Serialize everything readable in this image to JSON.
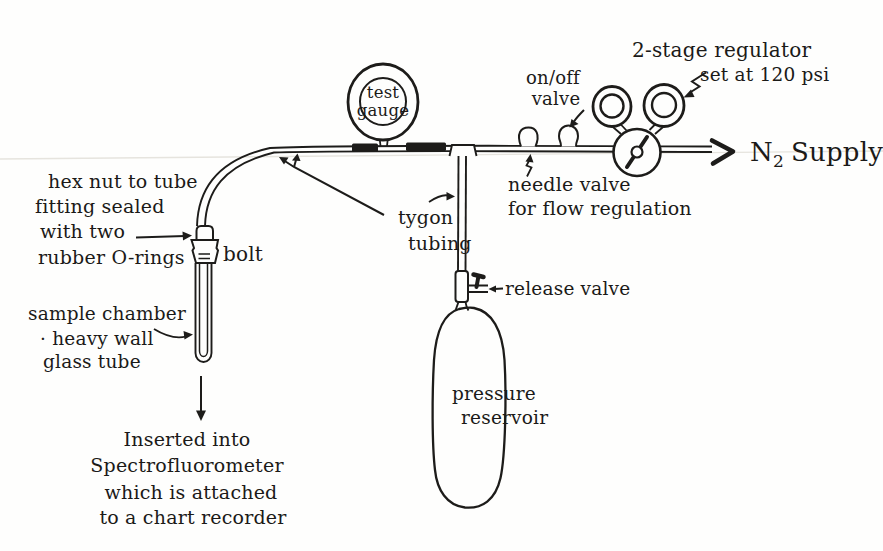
{
  "diagram_title": "Hand-drawn nitrogen pressurization apparatus schematic",
  "colors": {
    "ink": "#1d1c1a",
    "paper": "#fefefd"
  },
  "labels": {
    "hex_nut": [
      "hex nut to tube",
      "fitting sealed",
      "with two",
      "rubber O-rings"
    ],
    "bolt": "bolt",
    "sample_chamber": [
      "sample chamber",
      "· heavy wall",
      "glass tube"
    ],
    "inserted": [
      "Inserted into",
      "Spectrofluorometer",
      "which is attached",
      "to a chart recorder"
    ],
    "tygon": [
      "tygon",
      "tubing"
    ],
    "test_gauge": [
      "test",
      "gauge"
    ],
    "on_off_valve": [
      "on/off",
      "valve"
    ],
    "regulator": [
      "2-stage regulator",
      "set at 120 psi"
    ],
    "n2_supply": {
      "symbol": "N",
      "subscript": "2",
      "word": "Supply"
    },
    "needle_valve": [
      "needle valve",
      "for flow regulation"
    ],
    "release_valve": "release valve",
    "pressure_reservoir": [
      "pressure",
      "reservoir"
    ]
  }
}
